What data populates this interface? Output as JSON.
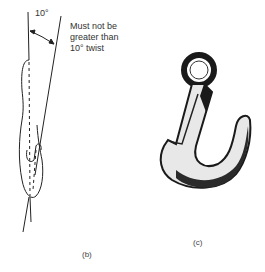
{
  "figure_b": {
    "angle_label": "10°",
    "note_lines": [
      "Must not be",
      "greater than",
      "10° twist"
    ],
    "caption": "(b)"
  },
  "figure_c": {
    "caption": "(c)"
  }
}
